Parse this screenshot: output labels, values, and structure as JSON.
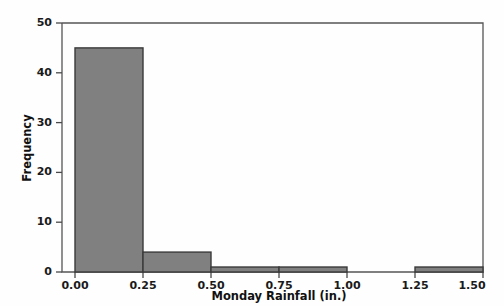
{
  "chart_data": {
    "type": "bar",
    "chart_subtype": "histogram",
    "title": "",
    "subtitle": "",
    "xlabel": "Monday Rainfall (in.)",
    "ylabel": "Frequency",
    "xlim": [
      -0.07,
      1.64
    ],
    "ylim": [
      0,
      51
    ],
    "grid": false,
    "legend": null,
    "bin_width": 0.25,
    "bin_edges": [
      0.0,
      0.25,
      0.5,
      0.75,
      1.0,
      1.25,
      1.5
    ],
    "categories": [
      "0.00-0.25",
      "0.25-0.50",
      "0.50-0.75",
      "0.75-1.00",
      "1.00-1.25",
      "1.25-1.50"
    ],
    "values": [
      45,
      4,
      1,
      1,
      0,
      1
    ],
    "bars": [
      {
        "left": 0.0,
        "right": 0.25,
        "value": 45
      },
      {
        "left": 0.25,
        "right": 0.5,
        "value": 4
      },
      {
        "left": 0.5,
        "right": 0.75,
        "value": 1
      },
      {
        "left": 0.75,
        "right": 1.0,
        "value": 1
      },
      {
        "left": 1.0,
        "right": 1.25,
        "value": 0
      },
      {
        "left": 1.25,
        "right": 1.5,
        "value": 1
      }
    ],
    "xticks": [
      0.0,
      0.25,
      0.5,
      0.75,
      1.0,
      1.25,
      1.5
    ],
    "xtick_labels": [
      "0.00",
      "0.25",
      "0.50",
      "0.75",
      "1.00",
      "1.25",
      "1.50"
    ],
    "yticks": [
      0,
      10,
      20,
      30,
      40,
      50
    ],
    "ytick_labels": [
      "0",
      "10",
      "20",
      "30",
      "40",
      "50"
    ],
    "colors": {
      "bar_fill": "#808080",
      "bar_edge": "#3a3a3a",
      "axis": "#4a4a4a",
      "frame": "#555555",
      "text": "#111111",
      "background": "#fefefe"
    }
  },
  "axis": {
    "x_title": "Monday Rainfall (in.)",
    "y_title": "Frequency"
  },
  "xticks": {
    "t0": "0.00",
    "t1": "0.25",
    "t2": "0.50",
    "t3": "0.75",
    "t4": "1.00",
    "t5": "1.25",
    "t6": "1.50"
  },
  "yticks": {
    "t0": "0",
    "t1": "10",
    "t2": "20",
    "t3": "30",
    "t4": "40",
    "t5": "50"
  }
}
